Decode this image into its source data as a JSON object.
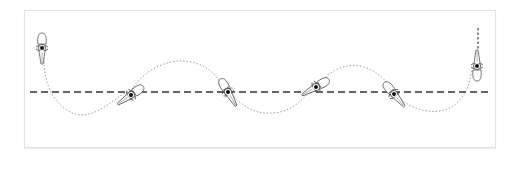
{
  "diagram": {
    "type": "trajectory-diagram",
    "colors": {
      "background": "#ffffff",
      "panel_border": "#e2e2e2",
      "reference_line": "#333333",
      "path": "#888888",
      "rider_outline": "#555555",
      "rider_center": "#111111"
    },
    "reference_line": {
      "style": "dashed",
      "y": 92,
      "x_start": 30,
      "x_end": 492
    },
    "path": {
      "style": "dotted",
      "d": "M 44 58 C 44 80 50 100 70 112 C 95 125 120 90 130 92 C 150 60 190 50 215 75 C 235 100 250 118 280 112 C 305 106 315 80 325 78 C 345 58 375 62 392 90 C 405 110 440 120 458 102 C 468 92 470 80 472 70"
    },
    "riders": [
      {
        "id": 1,
        "x": 42,
        "y": 48,
        "rotation": 0
      },
      {
        "id": 2,
        "x": 131,
        "y": 95,
        "rotation": 55
      },
      {
        "id": 3,
        "x": 228,
        "y": 92,
        "rotation": -30
      },
      {
        "id": 4,
        "x": 316,
        "y": 87,
        "rotation": 60
      },
      {
        "id": 5,
        "x": 394,
        "y": 94,
        "rotation": -40
      },
      {
        "id": 6,
        "x": 477,
        "y": 66,
        "rotation": 180
      }
    ],
    "end_marker": {
      "style": "dashed-vertical",
      "x": 478,
      "y_start": 28,
      "y_end": 50
    }
  }
}
